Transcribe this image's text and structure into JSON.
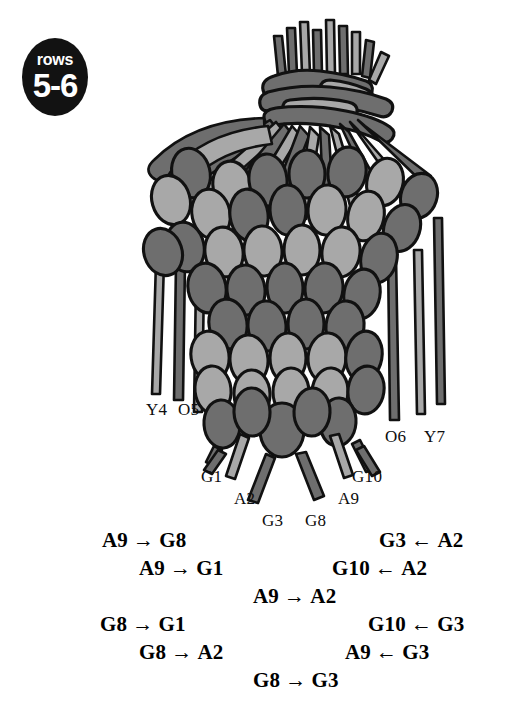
{
  "badge": {
    "line1": "rows",
    "line2": "5-6"
  },
  "diagram": {
    "colors": {
      "dark_strand": "#6e6e6e",
      "light_strand": "#a8a8a8",
      "outline": "#111111",
      "background": "#ffffff",
      "badge_background": "#121212",
      "badge_text": "#ffffff"
    },
    "thread_labels": [
      {
        "id": "label-y4",
        "text": "Y4",
        "x": 146,
        "y": 400
      },
      {
        "id": "label-o5",
        "text": "O5",
        "x": 178,
        "y": 400
      },
      {
        "id": "label-o6",
        "text": "O6",
        "x": 385,
        "y": 427
      },
      {
        "id": "label-y7",
        "text": "Y7",
        "x": 424,
        "y": 427
      },
      {
        "id": "label-g1",
        "text": "G1",
        "x": 201,
        "y": 467
      },
      {
        "id": "label-g10",
        "text": "G10",
        "x": 352,
        "y": 467
      },
      {
        "id": "label-a2",
        "text": "A2",
        "x": 234,
        "y": 489
      },
      {
        "id": "label-a9",
        "text": "A9",
        "x": 338,
        "y": 489
      },
      {
        "id": "label-g3",
        "text": "G3",
        "x": 262,
        "y": 511
      },
      {
        "id": "label-g8",
        "text": "G8",
        "x": 305,
        "y": 511
      }
    ]
  },
  "instructions": {
    "rows": [
      [
        {
          "left": "A9",
          "arrow": "→",
          "right": "G8",
          "x": 102,
          "align": "left"
        },
        {
          "left": "G3",
          "arrow": "←",
          "right": "A2",
          "x": 379,
          "align": "left"
        }
      ],
      [
        {
          "left": "A9",
          "arrow": "→",
          "right": "G1",
          "x": 139,
          "align": "left"
        },
        {
          "left": "G10",
          "arrow": "←",
          "right": "A2",
          "x": 332,
          "align": "left"
        }
      ],
      [
        {
          "left": "A9",
          "arrow": "→",
          "right": "A2",
          "x": 253,
          "align": "center"
        }
      ],
      [
        {
          "left": "G8",
          "arrow": "→",
          "right": "G1",
          "x": 100,
          "align": "left"
        },
        {
          "left": "G10",
          "arrow": "←",
          "right": "G3",
          "x": 368,
          "align": "left"
        }
      ],
      [
        {
          "left": "G8",
          "arrow": "→",
          "right": "A2",
          "x": 139,
          "align": "left"
        },
        {
          "left": "A9",
          "arrow": "←",
          "right": "G3",
          "x": 345,
          "align": "left"
        }
      ],
      [
        {
          "left": "G8",
          "arrow": "→",
          "right": "G3",
          "x": 253,
          "align": "center"
        }
      ]
    ]
  }
}
